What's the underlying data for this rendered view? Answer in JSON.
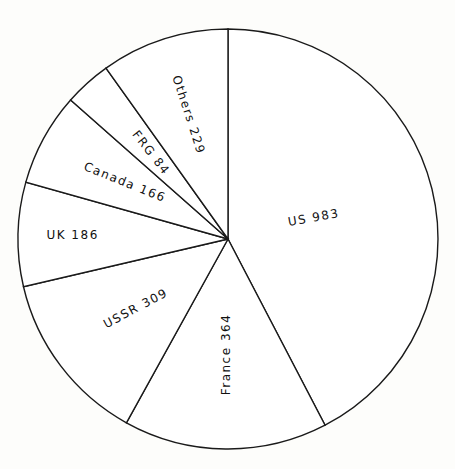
{
  "chart_data": {
    "type": "pie",
    "title": "",
    "slices": [
      {
        "label": "US",
        "value": 983,
        "text": "US   983"
      },
      {
        "label": "France",
        "value": 364,
        "text": "France  364"
      },
      {
        "label": "USSR",
        "value": 309,
        "text": "USSR  309"
      },
      {
        "label": "UK",
        "value": 186,
        "text": "UK 186"
      },
      {
        "label": "Canada",
        "value": 166,
        "text": "Canada 166"
      },
      {
        "label": "FRG",
        "value": 84,
        "text": "FRG 84"
      },
      {
        "label": "Others",
        "value": 229,
        "text": "Others  229"
      }
    ],
    "start_angle_deg": -90,
    "direction": "clockwise",
    "colors": {
      "fill": "#ffffff",
      "stroke": "#1a1a1a",
      "background": "#fdfdfb"
    }
  }
}
